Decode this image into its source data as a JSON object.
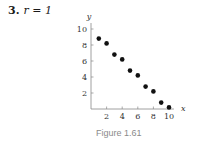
{
  "problem": {
    "number": "3.",
    "equation": "r = 1"
  },
  "caption": "Figure 1.61",
  "chart_data": {
    "type": "scatter",
    "title": "",
    "xlabel": "x",
    "ylabel": "y",
    "xlim": [
      0,
      10.5
    ],
    "ylim": [
      0,
      10.5
    ],
    "x_ticks": [
      2,
      4,
      6,
      8,
      10
    ],
    "y_ticks": [
      2,
      4,
      6,
      8,
      10
    ],
    "grid": false,
    "legend": null,
    "x": [
      1,
      2,
      3,
      4,
      5,
      6,
      7,
      8,
      9,
      10
    ],
    "y": [
      8.8,
      8.2,
      6.8,
      6.2,
      4.8,
      4.2,
      2.8,
      2.2,
      0.8,
      0.2
    ],
    "annotation": "r = 1",
    "marker_color": "#111111"
  }
}
